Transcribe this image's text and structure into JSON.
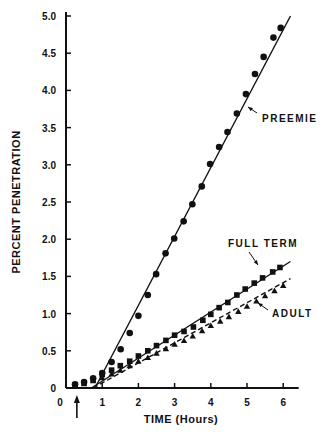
{
  "chart_data": {
    "type": "scatter",
    "title": "",
    "xlabel": "TIME (Hours)",
    "ylabel": "PERCENT PENETRATION",
    "xlim": [
      0,
      6.4
    ],
    "ylim": [
      0,
      5.0
    ],
    "grid": false,
    "x_ticks": [
      0,
      1,
      2,
      3,
      4,
      5,
      6
    ],
    "x_tick_labels": [
      "0",
      "1",
      "2",
      "3",
      "4",
      "5",
      "6"
    ],
    "y_ticks": [
      0,
      0.5,
      1.0,
      1.5,
      2.0,
      2.5,
      3.0,
      3.5,
      4.0,
      4.5,
      5.0
    ],
    "y_tick_labels": [
      "0",
      "0.5",
      "1.0",
      "1.5",
      "2.0",
      "2.5",
      "3.0",
      "3.5",
      "4.0",
      "4.5",
      "5.0"
    ],
    "marker_annotation": {
      "x": 0.3,
      "symbol": "up-arrow"
    },
    "series": [
      {
        "name": "PREEMIE",
        "marker": "circle",
        "line_style": "solid",
        "fit_line": [
          [
            0.8,
            0.0
          ],
          [
            6.2,
            5.0
          ]
        ],
        "label_at": [
          5.4,
          3.8
        ],
        "x": [
          0.25,
          0.5,
          0.75,
          1.0,
          1.26,
          1.51,
          1.76,
          2.0,
          2.26,
          2.49,
          2.75,
          2.99,
          3.25,
          3.49,
          3.75,
          3.98,
          4.23,
          4.46,
          4.72,
          4.97,
          5.22,
          5.46,
          5.73,
          5.93
        ],
        "y": [
          0.05,
          0.08,
          0.13,
          0.2,
          0.35,
          0.52,
          0.74,
          0.97,
          1.25,
          1.53,
          1.81,
          2.01,
          2.24,
          2.47,
          2.71,
          3.01,
          3.24,
          3.44,
          3.69,
          3.95,
          4.22,
          4.45,
          4.71,
          4.84
        ]
      },
      {
        "name": "FULL TERM",
        "marker": "square",
        "line_style": "solid",
        "fit_line": [
          [
            0.7,
            0.0
          ],
          [
            6.2,
            1.7
          ]
        ],
        "label_at": [
          4.3,
          1.9
        ],
        "x": [
          0.25,
          0.5,
          0.75,
          1.0,
          1.26,
          1.5,
          1.76,
          2.0,
          2.26,
          2.5,
          2.76,
          3.0,
          3.26,
          3.52,
          3.78,
          4.0,
          4.23,
          4.47,
          4.72,
          4.95,
          5.2,
          5.43,
          5.71,
          5.91
        ],
        "y": [
          0.04,
          0.07,
          0.11,
          0.18,
          0.24,
          0.3,
          0.36,
          0.43,
          0.5,
          0.57,
          0.64,
          0.71,
          0.76,
          0.82,
          0.91,
          0.99,
          1.08,
          1.15,
          1.25,
          1.33,
          1.41,
          1.48,
          1.56,
          1.62
        ]
      },
      {
        "name": "ADULT",
        "marker": "triangle",
        "line_style": "dashed",
        "fit_line": [
          [
            0.75,
            0.0
          ],
          [
            6.2,
            1.47
          ]
        ],
        "label_at": [
          4.9,
          0.95
        ],
        "x": [
          0.25,
          0.5,
          0.75,
          1.0,
          1.26,
          1.5,
          1.76,
          2.0,
          2.26,
          2.5,
          2.76,
          3.0,
          3.26,
          3.5,
          3.76,
          4.0,
          4.26,
          4.5,
          4.76,
          5.0,
          5.26,
          5.5,
          5.76,
          6.0
        ],
        "y": [
          0.03,
          0.06,
          0.1,
          0.14,
          0.19,
          0.24,
          0.3,
          0.36,
          0.41,
          0.47,
          0.53,
          0.59,
          0.64,
          0.7,
          0.77,
          0.84,
          0.9,
          0.96,
          1.03,
          1.1,
          1.17,
          1.24,
          1.31,
          1.38
        ]
      }
    ]
  }
}
